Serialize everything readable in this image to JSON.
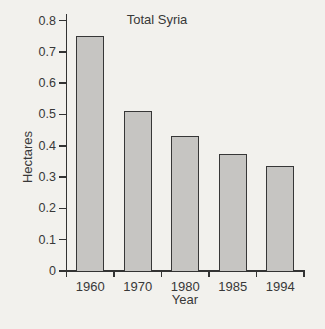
{
  "figure": {
    "title": "Total Syria",
    "ylabel": "Hectares",
    "xlabel": "Year"
  },
  "chart_data": {
    "type": "bar",
    "title": "Total Syria",
    "xlabel": "Year",
    "ylabel": "Hectares",
    "categories": [
      "1960",
      "1970",
      "1980",
      "1985",
      "1994"
    ],
    "values": [
      0.75,
      0.51,
      0.43,
      0.375,
      0.335
    ],
    "ylim": [
      0,
      0.8
    ],
    "ytick_step": 0.1,
    "ytick_labels": [
      "0",
      "0.1",
      "0.2",
      "0.3",
      "0.4",
      "0.5",
      "0.6",
      "0.7",
      "0.8"
    ],
    "grid": false,
    "legend": "none",
    "colors": {
      "bar_fill": "#c6c5c2",
      "bar_border": "#373737",
      "axis": "#333333",
      "text": "#383838",
      "background": "#f2f1ed"
    }
  }
}
